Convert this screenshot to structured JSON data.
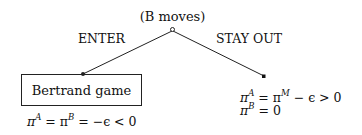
{
  "diagram": {
    "type": "game-tree",
    "root_node": {
      "label": "(B moves)",
      "player": "B",
      "icon": "open-circle-node"
    },
    "branches": [
      {
        "label": "ENTER",
        "to": "Bertrand game",
        "terminal": {
          "kind": "box",
          "label": "Bertrand game",
          "payoffs": {
            "line1": {
              "pi": "π",
              "sup1": "A",
              "eq1": " = π",
              "sup2": "B",
              "rest": " = −ϵ < 0"
            }
          }
        }
      },
      {
        "label": "STAY OUT",
        "terminal": {
          "kind": "filled-square-node",
          "payoffs": {
            "line1": {
              "pi": "π",
              "sup1": "A",
              "eq1": " = π",
              "sup2": "M",
              "rest": " − ϵ > 0"
            },
            "line2": {
              "pi": "π",
              "sup1": "B",
              "rest": " = 0"
            }
          }
        }
      }
    ]
  }
}
